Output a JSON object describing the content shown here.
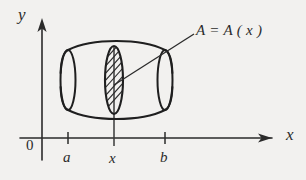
{
  "figure": {
    "kind": "calculus-solid-of-revolution-cross-section",
    "background_color": "#f2f1ef",
    "ink_color": "#2b2b2b"
  },
  "axes": {
    "y_label": "y",
    "x_label": "x",
    "origin_label": "0",
    "x_axis_y": 138,
    "y_axis_x": 42,
    "x_axis_start": 20,
    "x_axis_end": 278,
    "y_axis_top": 18
  },
  "ticks": [
    {
      "label": "a",
      "x": 68
    },
    {
      "label": "x",
      "x": 114
    },
    {
      "label": "b",
      "x": 165
    }
  ],
  "solid": {
    "name": "barrel-solid",
    "left_x": 68,
    "right_x": 165,
    "top_y": 48,
    "bottom_y": 112,
    "cap_rx": 7,
    "bulge": 9
  },
  "cross_section": {
    "name": "hatched-cross-section",
    "center_x": 114,
    "center_y": 80,
    "rx": 9,
    "ry": 34,
    "hatch_count": 9
  },
  "annotation": {
    "text": "A = A ( x )",
    "leader_from_x": 114,
    "leader_from_y": 84,
    "leader_to_x": 194,
    "leader_to_y": 34
  },
  "vertical_line": {
    "name": "ordinate-at-x",
    "x": 114,
    "top_y": 46,
    "bottom_y": 146
  }
}
